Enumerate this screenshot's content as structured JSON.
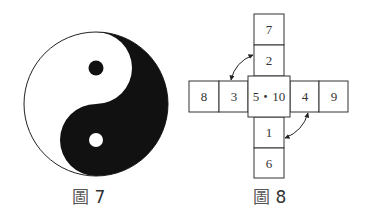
{
  "figure7": {
    "caption_char": "圖",
    "caption_num": "7",
    "description": "yin-yang symbol"
  },
  "figure8": {
    "caption_char": "圖",
    "caption_num": "8",
    "cells": {
      "top_outer": "7",
      "top_inner": "2",
      "left_outer": "8",
      "left_inner": "3",
      "center": "5・10",
      "right_inner": "4",
      "right_outer": "9",
      "bottom_inner": "1",
      "bottom_outer": "6"
    }
  }
}
